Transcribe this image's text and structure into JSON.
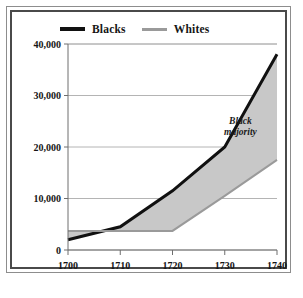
{
  "figure": {
    "background_color": "#ffffff",
    "frame_outer_color": "#8d8d8d",
    "frame_inner_color": "#4a4a4a"
  },
  "legend": {
    "position": "above-plot",
    "entries": [
      {
        "label": "Blacks",
        "color": "#111111",
        "icon": "line-swatch-thick"
      },
      {
        "label": "Whites",
        "color": "#9a9a9a",
        "icon": "line-swatch-thin"
      }
    ]
  },
  "annotations": [
    {
      "text_line_1": "Black",
      "text_line_2": "majority",
      "x": 1733,
      "y": 24500
    }
  ],
  "chart_data": {
    "type": "line",
    "title": "",
    "subtitle": "",
    "xlabel": "",
    "ylabel": "",
    "x": [
      1700,
      1710,
      1720,
      1730,
      1740
    ],
    "xtick_labels": [
      "1700",
      "1710",
      "1720",
      "1730",
      "1740"
    ],
    "ytick_labels": [
      "0",
      "10,000",
      "20,000",
      "30,000",
      "40,000"
    ],
    "ytick_values": [
      0,
      10000,
      20000,
      30000,
      40000
    ],
    "xlim": [
      1700,
      1740
    ],
    "ylim": [
      0,
      40000
    ],
    "grid": "horizontal",
    "grid_color": "#b4b4b4",
    "legend_position": "top",
    "fill_between": {
      "between": [
        "Blacks",
        "Whites"
      ],
      "color": "#c8c8c8",
      "label": "Black majority"
    },
    "series": [
      {
        "name": "Blacks",
        "color": "#111111",
        "line_width": 3,
        "values": [
          2000,
          4500,
          11500,
          20000,
          38000
        ]
      },
      {
        "name": "Whites",
        "color": "#9a9a9a",
        "line_width": 2,
        "values": [
          3700,
          3700,
          3700,
          10500,
          17500
        ]
      }
    ]
  }
}
